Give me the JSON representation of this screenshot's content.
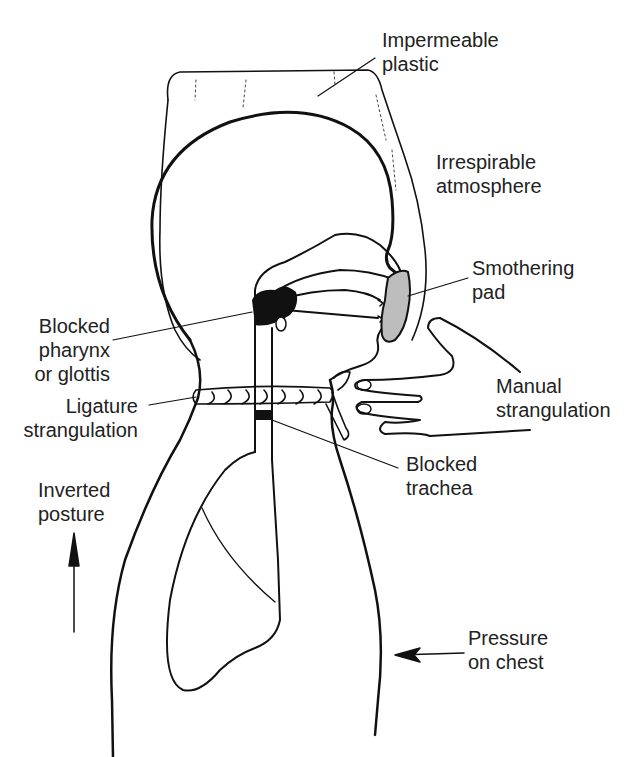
{
  "figure": {
    "colors": {
      "ink": "#111111",
      "label": "#222222",
      "pad_fill": "#bdbdbd",
      "background": "#ffffff"
    },
    "labels": [
      {
        "id": "impermeable-plastic",
        "lines": [
          "Impermeable",
          "plastic"
        ]
      },
      {
        "id": "irrespirable-atmosphere",
        "lines": [
          "Irrespirable",
          "atmosphere"
        ]
      },
      {
        "id": "smothering-pad",
        "lines": [
          "Smothering",
          "pad"
        ]
      },
      {
        "id": "blocked-pharynx",
        "lines": [
          "Blocked",
          "pharynx",
          "or glottis"
        ]
      },
      {
        "id": "manual-strangulation",
        "lines": [
          "Manual",
          "strangulation"
        ]
      },
      {
        "id": "ligature-strangulation",
        "lines": [
          "Ligature",
          "strangulation"
        ]
      },
      {
        "id": "blocked-trachea",
        "lines": [
          "Blocked",
          "trachea"
        ]
      },
      {
        "id": "inverted-posture",
        "lines": [
          "Inverted",
          "posture"
        ]
      },
      {
        "id": "pressure-on-chest",
        "lines": [
          "Pressure",
          "on chest"
        ]
      }
    ]
  }
}
